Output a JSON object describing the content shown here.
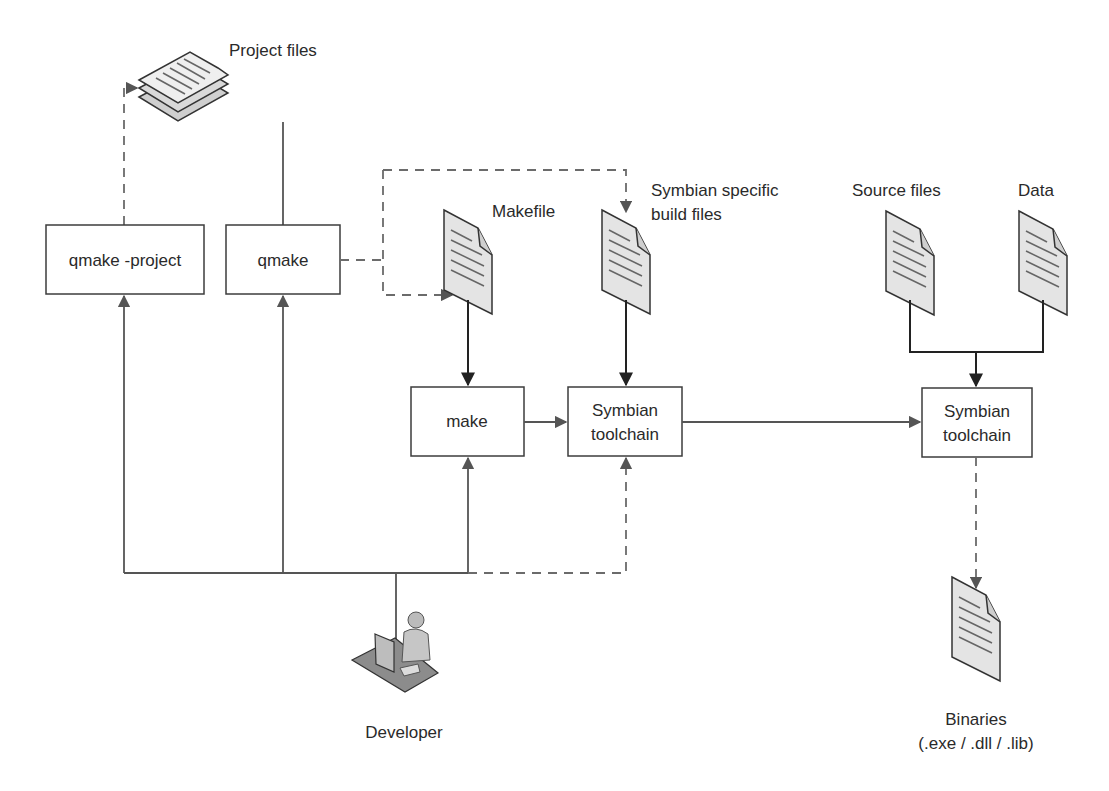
{
  "diagram": {
    "type": "build-flow",
    "nodes": {
      "qmake_project": {
        "label": "qmake -project"
      },
      "qmake": {
        "label": "qmake"
      },
      "make": {
        "label": "make"
      },
      "symbian_toolchain_1": {
        "line1": "Symbian",
        "line2": "toolchain"
      },
      "symbian_toolchain_2": {
        "line1": "Symbian",
        "line2": "toolchain"
      }
    },
    "files": {
      "project_files": {
        "label": "Project files"
      },
      "makefile": {
        "label": "Makefile"
      },
      "symbian_build_files": {
        "line1": "Symbian specific",
        "line2": "build files"
      },
      "source_files": {
        "label": "Source files"
      },
      "data": {
        "label": "Data"
      },
      "binaries": {
        "line1": "Binaries",
        "line2": "(.exe / .dll / .lib)"
      }
    },
    "actor": {
      "label": "Developer"
    },
    "edges": [
      {
        "from": "qmake -project",
        "to": "Project files",
        "style": "dashed"
      },
      {
        "from": "Project files",
        "to": "qmake",
        "style": "solid"
      },
      {
        "from": "qmake",
        "to": "Makefile",
        "style": "dashed"
      },
      {
        "from": "qmake",
        "to": "Symbian specific build files",
        "style": "dashed"
      },
      {
        "from": "Makefile",
        "to": "make",
        "style": "solid"
      },
      {
        "from": "Symbian specific build files",
        "to": "Symbian toolchain",
        "style": "solid"
      },
      {
        "from": "make",
        "to": "Symbian toolchain",
        "style": "solid"
      },
      {
        "from": "Symbian toolchain",
        "to": "Symbian toolchain (2)",
        "style": "solid"
      },
      {
        "from": "Source files",
        "to": "Symbian toolchain (2)",
        "style": "solid"
      },
      {
        "from": "Data",
        "to": "Symbian toolchain (2)",
        "style": "solid"
      },
      {
        "from": "Symbian toolchain (2)",
        "to": "Binaries",
        "style": "dashed"
      },
      {
        "from": "Developer",
        "to": "qmake -project",
        "style": "solid"
      },
      {
        "from": "Developer",
        "to": "qmake",
        "style": "solid"
      },
      {
        "from": "Developer",
        "to": "make",
        "style": "solid"
      },
      {
        "from": "Developer",
        "to": "Symbian toolchain",
        "style": "dashed"
      }
    ]
  }
}
